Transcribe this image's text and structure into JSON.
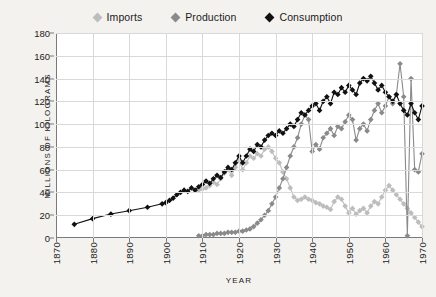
{
  "legend": {
    "position": "top-center",
    "items": [
      {
        "label": "Imports",
        "color": "#bdbdbd",
        "marker": "diamond-marker-imports"
      },
      {
        "label": "Production",
        "color": "#8a8a8a",
        "marker": "diamond-marker-production"
      },
      {
        "label": "Consumption",
        "color": "#111111",
        "marker": "diamond-marker-consumption"
      }
    ]
  },
  "axes": {
    "ylabel": "MILLIONS OF KILOGRAMS",
    "xlabel": "YEAR",
    "yticks": [
      0,
      20,
      40,
      60,
      80,
      100,
      120,
      140,
      160,
      180
    ],
    "xticks": [
      1870,
      1880,
      1890,
      1900,
      1910,
      1920,
      1930,
      1940,
      1950,
      1960,
      1970
    ]
  },
  "chart_data": {
    "type": "line",
    "title": "",
    "xlabel": "YEAR",
    "ylabel": "MILLIONS OF KILOGRAMS",
    "xlim": [
      1870,
      1970
    ],
    "ylim": [
      0,
      180
    ],
    "grid": true,
    "legend_position": "top-center",
    "series": [
      {
        "name": "Imports",
        "color": "#bdbdbd",
        "points": [
          [
            1909,
            42
          ],
          [
            1910,
            43
          ],
          [
            1911,
            44
          ],
          [
            1912,
            46
          ],
          [
            1913,
            49
          ],
          [
            1914,
            47
          ],
          [
            1915,
            52
          ],
          [
            1916,
            57
          ],
          [
            1917,
            60
          ],
          [
            1918,
            55
          ],
          [
            1919,
            62
          ],
          [
            1920,
            68
          ],
          [
            1921,
            60
          ],
          [
            1922,
            66
          ],
          [
            1923,
            72
          ],
          [
            1924,
            70
          ],
          [
            1925,
            74
          ],
          [
            1926,
            72
          ],
          [
            1927,
            78
          ],
          [
            1928,
            80
          ],
          [
            1929,
            76
          ],
          [
            1930,
            70
          ],
          [
            1931,
            66
          ],
          [
            1932,
            58
          ],
          [
            1933,
            52
          ],
          [
            1934,
            44
          ],
          [
            1935,
            36
          ],
          [
            1936,
            33
          ],
          [
            1937,
            34
          ],
          [
            1938,
            36
          ],
          [
            1939,
            34
          ],
          [
            1940,
            33
          ],
          [
            1941,
            31
          ],
          [
            1942,
            30
          ],
          [
            1943,
            28
          ],
          [
            1944,
            27
          ],
          [
            1945,
            25
          ],
          [
            1946,
            32
          ],
          [
            1947,
            36
          ],
          [
            1948,
            34
          ],
          [
            1949,
            28
          ],
          [
            1950,
            22
          ],
          [
            1951,
            26
          ],
          [
            1952,
            21
          ],
          [
            1953,
            24
          ],
          [
            1954,
            26
          ],
          [
            1955,
            22
          ],
          [
            1956,
            28
          ],
          [
            1957,
            32
          ],
          [
            1958,
            30
          ],
          [
            1959,
            36
          ],
          [
            1960,
            42
          ],
          [
            1961,
            46
          ],
          [
            1962,
            42
          ],
          [
            1963,
            38
          ],
          [
            1964,
            34
          ],
          [
            1965,
            30
          ],
          [
            1966,
            26
          ],
          [
            1967,
            22
          ],
          [
            1968,
            18
          ],
          [
            1969,
            14
          ],
          [
            1970,
            10
          ]
        ]
      },
      {
        "name": "Production",
        "color": "#8a8a8a",
        "points": [
          [
            1909,
            2
          ],
          [
            1910,
            2
          ],
          [
            1911,
            3
          ],
          [
            1912,
            3
          ],
          [
            1913,
            3
          ],
          [
            1914,
            4
          ],
          [
            1915,
            4
          ],
          [
            1916,
            4
          ],
          [
            1917,
            5
          ],
          [
            1918,
            5
          ],
          [
            1919,
            5
          ],
          [
            1920,
            6
          ],
          [
            1921,
            6
          ],
          [
            1922,
            7
          ],
          [
            1923,
            8
          ],
          [
            1924,
            10
          ],
          [
            1925,
            13
          ],
          [
            1926,
            16
          ],
          [
            1927,
            20
          ],
          [
            1928,
            24
          ],
          [
            1929,
            30
          ],
          [
            1930,
            36
          ],
          [
            1931,
            44
          ],
          [
            1932,
            52
          ],
          [
            1933,
            62
          ],
          [
            1934,
            72
          ],
          [
            1935,
            80
          ],
          [
            1936,
            88
          ],
          [
            1937,
            100
          ],
          [
            1938,
            108
          ],
          [
            1939,
            104
          ],
          [
            1940,
            76
          ],
          [
            1941,
            82
          ],
          [
            1942,
            78
          ],
          [
            1943,
            88
          ],
          [
            1944,
            92
          ],
          [
            1945,
            96
          ],
          [
            1946,
            90
          ],
          [
            1947,
            98
          ],
          [
            1948,
            96
          ],
          [
            1949,
            102
          ],
          [
            1950,
            108
          ],
          [
            1951,
            104
          ],
          [
            1952,
            86
          ],
          [
            1953,
            96
          ],
          [
            1954,
            100
          ],
          [
            1955,
            94
          ],
          [
            1956,
            104
          ],
          [
            1957,
            112
          ],
          [
            1958,
            118
          ],
          [
            1959,
            110
          ],
          [
            1960,
            116
          ],
          [
            1961,
            124
          ],
          [
            1962,
            118
          ],
          [
            1963,
            126
          ],
          [
            1964,
            153
          ],
          [
            1965,
            124
          ],
          [
            1966,
            2
          ],
          [
            1967,
            140
          ],
          [
            1968,
            60
          ],
          [
            1969,
            58
          ],
          [
            1970,
            74
          ]
        ]
      },
      {
        "name": "Consumption",
        "color": "#111111",
        "points": [
          [
            1875,
            12
          ],
          [
            1880,
            17
          ],
          [
            1885,
            21
          ],
          [
            1890,
            24
          ],
          [
            1895,
            27
          ],
          [
            1899,
            30
          ],
          [
            1900,
            31
          ],
          [
            1901,
            33
          ],
          [
            1902,
            35
          ],
          [
            1903,
            38
          ],
          [
            1904,
            40
          ],
          [
            1905,
            42
          ],
          [
            1906,
            41
          ],
          [
            1907,
            44
          ],
          [
            1908,
            42
          ],
          [
            1909,
            45
          ],
          [
            1910,
            47
          ],
          [
            1911,
            50
          ],
          [
            1912,
            48
          ],
          [
            1913,
            52
          ],
          [
            1914,
            55
          ],
          [
            1915,
            53
          ],
          [
            1916,
            58
          ],
          [
            1917,
            62
          ],
          [
            1918,
            60
          ],
          [
            1919,
            66
          ],
          [
            1920,
            72
          ],
          [
            1921,
            66
          ],
          [
            1922,
            72
          ],
          [
            1923,
            78
          ],
          [
            1924,
            76
          ],
          [
            1925,
            82
          ],
          [
            1926,
            80
          ],
          [
            1927,
            86
          ],
          [
            1928,
            90
          ],
          [
            1929,
            92
          ],
          [
            1930,
            90
          ],
          [
            1931,
            94
          ],
          [
            1932,
            92
          ],
          [
            1933,
            96
          ],
          [
            1934,
            100
          ],
          [
            1935,
            98
          ],
          [
            1936,
            104
          ],
          [
            1937,
            110
          ],
          [
            1938,
            108
          ],
          [
            1939,
            112
          ],
          [
            1940,
            116
          ],
          [
            1941,
            118
          ],
          [
            1942,
            112
          ],
          [
            1943,
            120
          ],
          [
            1944,
            124
          ],
          [
            1945,
            118
          ],
          [
            1946,
            128
          ],
          [
            1947,
            126
          ],
          [
            1948,
            132
          ],
          [
            1949,
            128
          ],
          [
            1950,
            134
          ],
          [
            1951,
            130
          ],
          [
            1952,
            126
          ],
          [
            1953,
            136
          ],
          [
            1954,
            140
          ],
          [
            1955,
            138
          ],
          [
            1956,
            142
          ],
          [
            1957,
            136
          ],
          [
            1958,
            130
          ],
          [
            1959,
            134
          ],
          [
            1960,
            128
          ],
          [
            1961,
            124
          ],
          [
            1962,
            120
          ],
          [
            1963,
            126
          ],
          [
            1964,
            118
          ],
          [
            1965,
            112
          ],
          [
            1966,
            108
          ],
          [
            1967,
            118
          ],
          [
            1968,
            110
          ],
          [
            1969,
            104
          ],
          [
            1970,
            116
          ]
        ]
      }
    ]
  }
}
